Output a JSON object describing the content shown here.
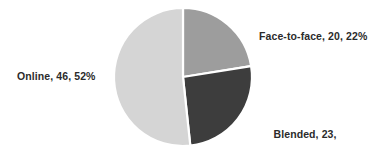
{
  "chart_data": {
    "type": "pie",
    "title": "",
    "subtitle": "",
    "xlabel": "",
    "ylabel": "",
    "categories": [
      "Face-to-face",
      "Blended",
      "Online"
    ],
    "values": [
      20,
      23,
      46
    ],
    "percentages": [
      22,
      26,
      52
    ],
    "total": 89,
    "colors": [
      "#9d9d9d",
      "#3d3d3d",
      "#d5d5d5"
    ],
    "background_color": "#ffffff",
    "label_color": "#2b2b2b",
    "slice_border_color": "#ffffff",
    "legend": "none",
    "grid": false,
    "start_angle_deg": 0,
    "direction": "clockwise",
    "slices": [
      {
        "name": "Face-to-face",
        "value": 20,
        "percent": 22,
        "color": "#9d9d9d",
        "start_angle_deg": 0,
        "end_angle_deg": 79.2,
        "label_text": "Face-to-face, 20, 22%",
        "label_lines": [
          "Face-to-face, 20, 22%"
        ],
        "label_position": "right"
      },
      {
        "name": "Blended",
        "value": 23,
        "percent": 26,
        "color": "#3d3d3d",
        "start_angle_deg": 79.2,
        "end_angle_deg": 172.8,
        "label_text": "Blended, 23, 26%",
        "label_lines": [
          "Blended, 23,",
          "26%"
        ],
        "label_position": "bottom-right"
      },
      {
        "name": "Online",
        "value": 46,
        "percent": 52,
        "color": "#d5d5d5",
        "start_angle_deg": 172.8,
        "end_angle_deg": 360,
        "label_text": "Online, 46, 52%",
        "label_lines": [
          "Online, 46, 52%"
        ],
        "label_position": "left"
      }
    ],
    "geometry": {
      "center_x": 183,
      "center_y": 77,
      "radius": 69
    }
  },
  "labels": {
    "face_to_face": "Face-to-face, 20, 22%",
    "online": "Online, 46, 52%",
    "blended_line1": "Blended, 23,",
    "blended_line2": "26%"
  }
}
